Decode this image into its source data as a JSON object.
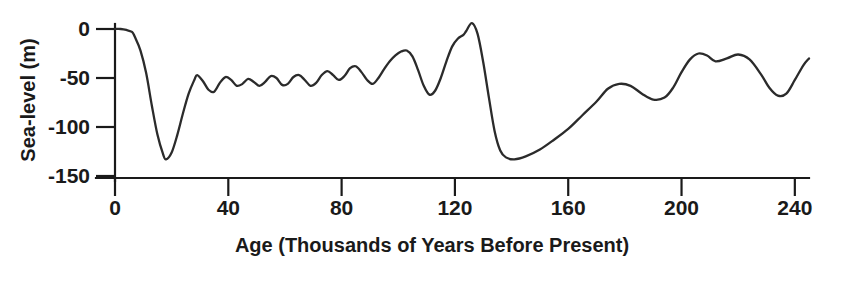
{
  "chart_data": {
    "type": "line",
    "title": "",
    "xlabel": "Age (Thousands of Years Before Present)",
    "ylabel": "Sea-level (m)",
    "xlim": [
      0,
      245
    ],
    "ylim": [
      -150,
      12
    ],
    "grid": false,
    "legend": "none",
    "xticks": [
      0,
      40,
      80,
      120,
      160,
      200,
      240
    ],
    "xtick_labels": [
      "0",
      "40",
      "80",
      "120",
      "160",
      "200",
      "240"
    ],
    "yticks": [
      0,
      -50,
      -100,
      -150
    ],
    "ytick_labels": [
      "0",
      "-50",
      "-100",
      "-150"
    ],
    "series": [
      {
        "name": "Sea level",
        "x": [
          0,
          2,
          4,
          6,
          7,
          9,
          11,
          13,
          15,
          17,
          18,
          20,
          22,
          24,
          26,
          28,
          29,
          31,
          33,
          35,
          37,
          39,
          41,
          43,
          45,
          47,
          49,
          51,
          53,
          55,
          57,
          59,
          61,
          63,
          65,
          67,
          69,
          71,
          73,
          75,
          77,
          79,
          81,
          83,
          85,
          87,
          89,
          91,
          93,
          95,
          97,
          99,
          101,
          103,
          105,
          107,
          109,
          111,
          113,
          115,
          117,
          119,
          121,
          123,
          124,
          126,
          128,
          130,
          132,
          134,
          136,
          138,
          141,
          145,
          150,
          155,
          160,
          165,
          170,
          174,
          178,
          182,
          186,
          190,
          194,
          197,
          200,
          203,
          206,
          209,
          212,
          216,
          220,
          224,
          228,
          231,
          234,
          237,
          240,
          243,
          245
        ],
        "y": [
          0,
          0,
          -1,
          -3,
          -8,
          -22,
          -45,
          -78,
          -108,
          -128,
          -133,
          -126,
          -108,
          -86,
          -66,
          -52,
          -47,
          -53,
          -62,
          -64,
          -55,
          -49,
          -52,
          -58,
          -56,
          -51,
          -54,
          -58,
          -54,
          -48,
          -50,
          -57,
          -56,
          -49,
          -47,
          -52,
          -58,
          -55,
          -47,
          -43,
          -47,
          -52,
          -48,
          -40,
          -38,
          -44,
          -52,
          -56,
          -50,
          -41,
          -33,
          -27,
          -23,
          -22,
          -28,
          -42,
          -58,
          -67,
          -63,
          -50,
          -33,
          -18,
          -10,
          -6,
          -2,
          6,
          -5,
          -34,
          -70,
          -104,
          -124,
          -131,
          -133,
          -130,
          -123,
          -113,
          -102,
          -88,
          -74,
          -61,
          -56,
          -58,
          -66,
          -72,
          -70,
          -60,
          -44,
          -31,
          -25,
          -27,
          -33,
          -30,
          -26,
          -31,
          -46,
          -60,
          -68,
          -66,
          -52,
          -37,
          -30
        ],
        "color": "#2b2b2b"
      }
    ],
    "note_values": {
      "lgm_lowstand_age": 18,
      "lgm_lowstand_value": -133,
      "mis5e_highstand_age": 126,
      "mis5e_highstand_value": 6,
      "mis6_lowstand_age": 141,
      "mis6_lowstand_value": -133
    }
  },
  "axes": {
    "y_title": "Sea-level (m)",
    "x_title": "Age (Thousands of Years Before Present)"
  }
}
